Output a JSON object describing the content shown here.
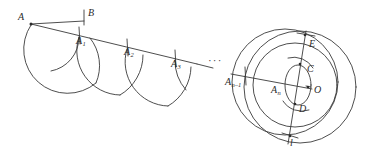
{
  "figure": {
    "background_color": "#ffffff",
    "stroke_color": "#3a3a3a",
    "label_color": "#2b2b2b",
    "ellipsis": "···",
    "labels": [
      {
        "id": "A",
        "text": "A",
        "sub": "",
        "x": 18,
        "y": 17
      },
      {
        "id": "B",
        "text": "B",
        "sub": "",
        "x": 88,
        "y": 12
      },
      {
        "id": "A1",
        "text": "A",
        "sub": "1",
        "x": 76,
        "y": 39
      },
      {
        "id": "A2",
        "text": "A",
        "sub": "2",
        "x": 124,
        "y": 50
      },
      {
        "id": "A3",
        "text": "A",
        "sub": "3",
        "x": 171,
        "y": 62
      },
      {
        "id": "An-1",
        "text": "A",
        "sub": "n–1",
        "x": 227,
        "y": 80
      },
      {
        "id": "An",
        "text": "A",
        "sub": "n",
        "x": 273,
        "y": 88
      },
      {
        "id": "E",
        "text": "E",
        "sub": "",
        "x": 309,
        "y": 45
      },
      {
        "id": "C",
        "text": "C",
        "sub": "",
        "x": 308,
        "y": 69
      },
      {
        "id": "O",
        "text": "O",
        "sub": "",
        "x": 314,
        "y": 89
      },
      {
        "id": "D",
        "text": "D",
        "sub": "",
        "x": 300,
        "y": 109
      },
      {
        "id": "l",
        "text": "l",
        "sub": "",
        "x": 292,
        "y": 144
      }
    ],
    "points": [
      {
        "id": "A",
        "x": 31,
        "y": 24
      },
      {
        "id": "B",
        "x": 84,
        "y": 22
      },
      {
        "id": "A1",
        "x": 79,
        "y": 36
      },
      {
        "id": "A2",
        "x": 127,
        "y": 48
      },
      {
        "id": "A3",
        "x": 175,
        "y": 59
      },
      {
        "id": "An-1",
        "x": 244,
        "y": 76
      },
      {
        "id": "An",
        "x": 288,
        "y": 86
      },
      {
        "id": "O",
        "x": 308,
        "y": 87
      },
      {
        "id": "E",
        "x": 305,
        "y": 35
      },
      {
        "id": "C",
        "x": 300,
        "y": 64
      },
      {
        "id": "D",
        "x": 295,
        "y": 104
      },
      {
        "id": "l",
        "x": 290,
        "y": 136
      }
    ]
  }
}
